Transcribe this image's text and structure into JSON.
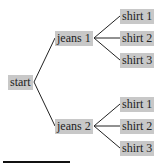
{
  "tree": {
    "root": {
      "label": "start"
    },
    "branches": [
      {
        "label": "jeans 1",
        "children": [
          {
            "label": "shirt 1"
          },
          {
            "label": "shirt 2"
          },
          {
            "label": "shirt 3"
          }
        ]
      },
      {
        "label": "jeans 2",
        "children": [
          {
            "label": "shirt 1"
          },
          {
            "label": "shirt 2"
          },
          {
            "label": "shirt 3"
          }
        ]
      }
    ]
  }
}
